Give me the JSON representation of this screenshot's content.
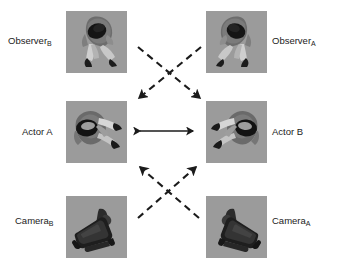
{
  "figure": {
    "background_color": "#ffffff",
    "panel_background_color": "#9b9b9b",
    "ink_color": "#1b1b1b",
    "panels": [
      {
        "id": "observer-b",
        "row": "top",
        "column": "left",
        "depicts": "person-top-down-icon",
        "label_text": "Observer",
        "label_subscript": "B"
      },
      {
        "id": "observer-a",
        "row": "top",
        "column": "right",
        "depicts": "person-top-down-icon",
        "label_text": "Observer",
        "label_subscript": "A"
      },
      {
        "id": "actor-a",
        "row": "middle",
        "column": "left",
        "depicts": "person-top-down-icon",
        "label_text": "Actor A",
        "label_subscript": ""
      },
      {
        "id": "actor-b",
        "row": "middle",
        "column": "right",
        "depicts": "person-top-down-icon",
        "label_text": "Actor B",
        "label_subscript": ""
      },
      {
        "id": "camera-b",
        "row": "bottom",
        "column": "left",
        "depicts": "video-camera-icon",
        "label_text": "Camera",
        "label_subscript": "B"
      },
      {
        "id": "camera-a",
        "row": "bottom",
        "column": "right",
        "depicts": "video-camera-icon",
        "label_text": "Camera",
        "label_subscript": "A"
      }
    ],
    "connections": [
      {
        "id": "observer-b-to-actor-b",
        "style": "dashed",
        "arrowheads": "end",
        "from": "observer-b",
        "to": "actor-b"
      },
      {
        "id": "observer-a-to-actor-a",
        "style": "dashed",
        "arrowheads": "end",
        "from": "observer-a",
        "to": "actor-a"
      },
      {
        "id": "actor-a-to-actor-b",
        "style": "solid",
        "arrowheads": "both",
        "from": "actor-a",
        "to": "actor-b"
      },
      {
        "id": "camera-b-to-actor-b",
        "style": "dashed",
        "arrowheads": "end",
        "from": "camera-b",
        "to": "actor-b"
      },
      {
        "id": "camera-a-to-actor-a",
        "style": "dashed",
        "arrowheads": "end",
        "from": "camera-a",
        "to": "actor-a"
      }
    ]
  }
}
